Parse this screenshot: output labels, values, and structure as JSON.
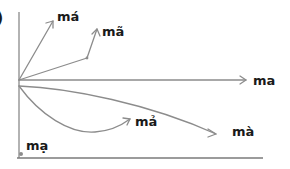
{
  "diagram": {
    "type": "tone-contour-diagram",
    "panel_marker": ")",
    "colors": {
      "line": "#8c8c8c",
      "axis": "#8a8a8a",
      "text": "#1a1a1a",
      "dot": "#8c8c8c"
    },
    "tones": [
      {
        "id": "ma",
        "label": "ma",
        "shape": "level-arrow"
      },
      {
        "id": "ma-acute",
        "label": "má",
        "shape": "rising-steep-arrow"
      },
      {
        "id": "ma-tilde",
        "label": "mã",
        "shape": "rising-broken-arrow"
      },
      {
        "id": "ma-grave",
        "label": "mà",
        "shape": "falling-gentle-arrow"
      },
      {
        "id": "ma-hook",
        "label": "mả",
        "shape": "dipping-rising-arrow"
      },
      {
        "id": "ma-dot",
        "label": "mạ",
        "shape": "low-dot"
      }
    ]
  }
}
